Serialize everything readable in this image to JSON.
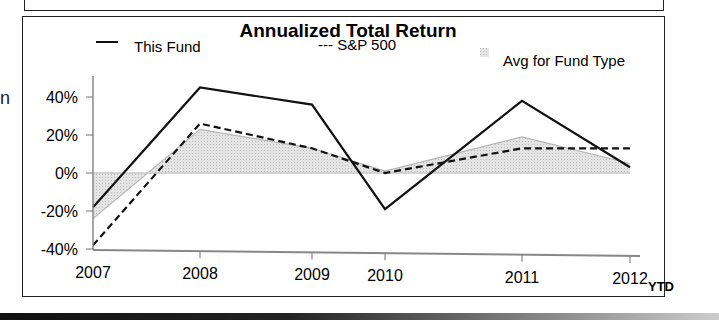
{
  "chart_data": {
    "type": "line",
    "title": "Annualized Total Return",
    "categories": [
      "2007",
      "2008",
      "2009",
      "2010",
      "2011",
      "2012"
    ],
    "x_suffix_label": "YTD",
    "series": [
      {
        "name": "This Fund",
        "style": "solid",
        "values": [
          -18,
          45,
          36,
          -19,
          38,
          3
        ]
      },
      {
        "name": "S&P 500",
        "style": "dashed",
        "values": [
          -38,
          26,
          13,
          0,
          13,
          13
        ]
      },
      {
        "name": "Avg for Fund Type",
        "style": "area",
        "values": [
          -24,
          23,
          13,
          1,
          19,
          5
        ]
      }
    ],
    "xlabel": "",
    "ylabel": "",
    "y_ticks": [
      "40%",
      "20%",
      "0%",
      "-20%",
      "-40%"
    ],
    "ylim": [
      -40,
      50
    ],
    "grid": false,
    "legend_position": "top"
  },
  "legend": {
    "fund_symbol": "—",
    "fund": "This Fund",
    "sp_label": "--- S&P 500",
    "avg": "Avg for Fund Type"
  },
  "title": "Annualized Total Return",
  "ytd": "YTD",
  "edge_fragment": "n",
  "colors": {
    "fund_line": "#111111",
    "sp_line": "#111111",
    "avg_fill": "#d9d9d9",
    "avg_line": "#b5b5b5",
    "axis": "#888888"
  }
}
